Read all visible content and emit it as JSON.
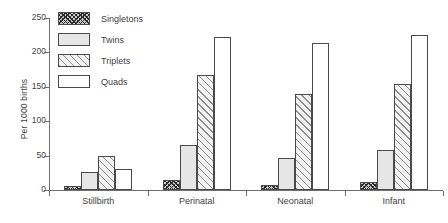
{
  "chart_data": {
    "type": "bar",
    "title": "",
    "xlabel": "",
    "ylabel": "Per 1000 births",
    "ylim": [
      0,
      250
    ],
    "yticks": [
      0,
      50,
      100,
      150,
      200,
      250
    ],
    "grid": false,
    "legend_position": "top-left",
    "categories": [
      "Stillbirth",
      "Perinatal",
      "Neonatal",
      "Infant"
    ],
    "series": [
      {
        "name": "Singletons",
        "pattern": "cross-hatch",
        "values": [
          6,
          15,
          8,
          11
        ]
      },
      {
        "name": "Twins",
        "pattern": "solid-light-gray",
        "values": [
          26,
          65,
          47,
          58
        ]
      },
      {
        "name": "Triplets",
        "pattern": "diagonal-hatch",
        "values": [
          49,
          167,
          139,
          154
        ]
      },
      {
        "name": "Quads",
        "pattern": "empty-white",
        "values": [
          31,
          222,
          213,
          226
        ]
      }
    ]
  },
  "axis": {
    "y_label": "Per 1000 births",
    "y_ticks": [
      "0",
      "50",
      "100",
      "150",
      "200",
      "250"
    ],
    "x_labels": [
      "Stillbirth",
      "Perinatal",
      "Neonatal",
      "Infant"
    ]
  },
  "legend": {
    "items": [
      {
        "label": "Singletons"
      },
      {
        "label": "Twins"
      },
      {
        "label": "Triplets"
      },
      {
        "label": "Quads"
      }
    ]
  }
}
